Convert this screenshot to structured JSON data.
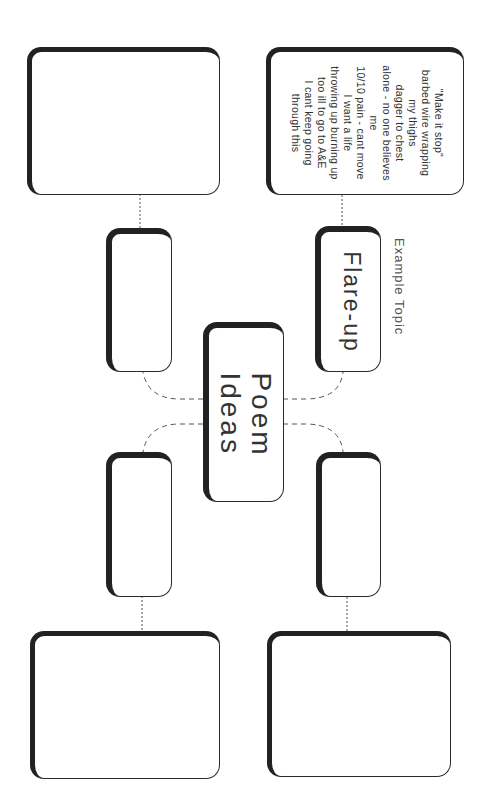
{
  "diagram": {
    "type": "mind-map",
    "orientation": "rotated-90deg-clockwise",
    "central_node": {
      "lines": [
        "Poem",
        "Ideas"
      ]
    },
    "example_caption": "Example Topic",
    "topics": [
      {
        "position": "top-right",
        "title": "Flare-up",
        "notes": [
          "\"Make it stop\"",
          "barbed wire wrapping",
          "my thighs",
          "dagger to chest",
          "alone - no one believes",
          "me",
          "10/10 pain - cant move",
          "I want a life",
          "throwing up burning up",
          "too ill to go to A&E",
          "I cant keep going",
          "through this"
        ]
      },
      {
        "position": "top-left",
        "title": "",
        "notes": []
      },
      {
        "position": "bottom-left",
        "title": "",
        "notes": []
      },
      {
        "position": "bottom-right",
        "title": "",
        "notes": []
      }
    ]
  },
  "colors": {
    "background": "#ffffff",
    "border": "#222222",
    "text": "#333333",
    "connector": "#555555"
  }
}
